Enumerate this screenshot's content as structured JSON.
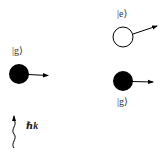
{
  "diagram": {
    "left_atom": {
      "state_label": "|g⟩",
      "fill": "#000000",
      "momentum_arrow": "right"
    },
    "photon": {
      "label": "ℏk",
      "direction": "up",
      "style": "wavy"
    },
    "top_right_atom": {
      "state_label": "|e⟩",
      "fill": "#ffffff",
      "momentum_arrow": "up-right"
    },
    "bottom_right_atom": {
      "state_label": "|g⟩",
      "fill": "#000000",
      "momentum_arrow": "right"
    },
    "colors": {
      "ink": "#000000",
      "label": "#333333",
      "background": "#ffffff"
    }
  }
}
